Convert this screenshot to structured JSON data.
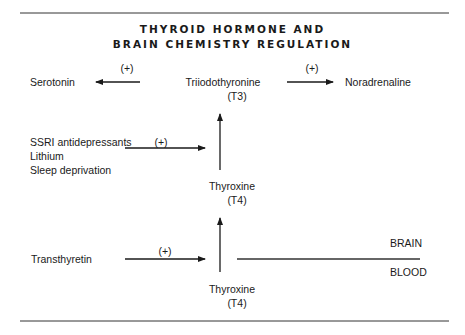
{
  "title": {
    "line1": "THYROID HORMONE AND",
    "line2": "BRAIN CHEMISTRY REGULATION"
  },
  "nodes": {
    "serotonin": "Serotonin",
    "t3_name": "Triiodothyronine",
    "t3_abbr": "(T3)",
    "noradrenaline": "Noradrenaline",
    "t4_brain_name": "Thyroxine",
    "t4_brain_abbr": "(T4)",
    "t4_blood_name": "Thyroxine",
    "t4_blood_abbr": "(T4)",
    "transthyretin": "Transthyretin"
  },
  "factors": [
    "SSRI antidepressants",
    "Lithium",
    "Sleep deprivation"
  ],
  "edge_labels": {
    "t3_to_serotonin": "(+)",
    "t3_to_noradrenaline": "(+)",
    "factors_to_conversion": "(+)",
    "transthyretin_to_transport": "(+)"
  },
  "compartments": {
    "upper": "BRAIN",
    "lower": "BLOOD"
  },
  "colors": {
    "ink": "#1a1a1a",
    "rule": "#333333",
    "background": "#ffffff"
  }
}
